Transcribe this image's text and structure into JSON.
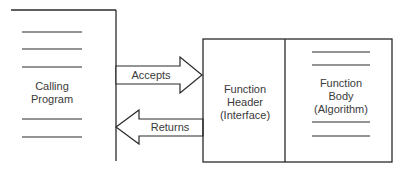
{
  "diagram": {
    "calling_program": {
      "label_line1": "Calling",
      "label_line2": "Program"
    },
    "arrows": {
      "accepts": "Accepts",
      "returns": "Returns"
    },
    "function_header": {
      "line1": "Function",
      "line2": "Header",
      "line3": "(Interface)"
    },
    "function_body": {
      "line1": "Function",
      "line2": "Body",
      "line3": "(Algorithm)"
    },
    "colors": {
      "stroke": "#2a2a2a",
      "text": "#3a3a3a",
      "background": "#ffffff"
    }
  }
}
